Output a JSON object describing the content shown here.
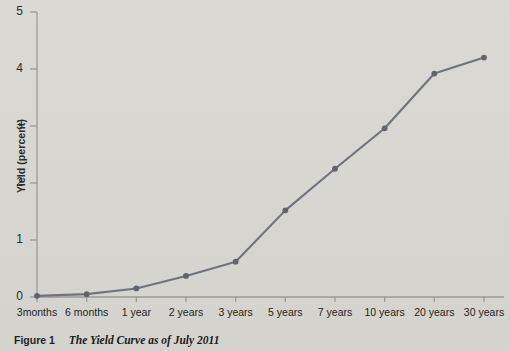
{
  "figure": {
    "number_label": "Figure 1",
    "title": "The Yield Curve as of July 2011"
  },
  "axes": {
    "y_title": "Yield (percent)",
    "y_ticks": [
      "0",
      "1",
      "2",
      "3",
      "4",
      "5"
    ],
    "x_ticks": [
      "3months",
      "6 months",
      "1 year",
      "2 years",
      "3 years",
      "5 years",
      "7 years",
      "10 years",
      "20 years",
      "30 years"
    ]
  },
  "colors": {
    "background": "#d9d7d1",
    "line": "#6e737c",
    "marker": "#5f646d",
    "axis": "#9a9a96",
    "text": "#222222"
  },
  "chart_data": {
    "type": "line",
    "title": "The Yield Curve as of July 2011",
    "xlabel": "",
    "ylabel": "Yield (percent)",
    "categories": [
      "3months",
      "6 months",
      "1 year",
      "2 years",
      "3 years",
      "5 years",
      "7 years",
      "10 years",
      "20 years",
      "30 years"
    ],
    "values": [
      0.02,
      0.05,
      0.15,
      0.37,
      0.62,
      1.52,
      2.25,
      2.96,
      3.92,
      4.2
    ],
    "ylim": [
      0,
      5
    ],
    "yticks": [
      0,
      1,
      2,
      3,
      4,
      5
    ],
    "grid": false,
    "legend": false,
    "markers": true
  }
}
